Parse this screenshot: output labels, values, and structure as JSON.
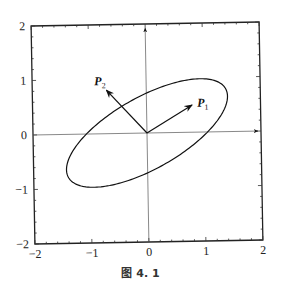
{
  "chart_data": {
    "type": "line",
    "title": "",
    "xlabel": "",
    "ylabel": "",
    "xlim": [
      -2,
      2
    ],
    "ylim": [
      -2,
      2
    ],
    "x_ticks": [
      "-2",
      "-1",
      "0",
      "1",
      "2"
    ],
    "y_ticks": [
      "-2",
      "-1",
      "0",
      "1",
      "2"
    ],
    "x_tick_values": [
      -2,
      -1,
      0,
      1,
      2
    ],
    "y_tick_values": [
      -2,
      -1,
      0,
      1,
      2
    ],
    "grid": false,
    "axes_through_origin": true,
    "ellipse": {
      "center": [
        0,
        0
      ],
      "semi_major": 1.6,
      "semi_minor": 0.65,
      "rotation_deg": 30
    },
    "vectors": [
      {
        "name": "P",
        "subscript": "1",
        "from": [
          0,
          0
        ],
        "to": [
          0.8,
          0.5
        ]
      },
      {
        "name": "P",
        "subscript": "2",
        "from": [
          0,
          0
        ],
        "to": [
          -0.7,
          0.8
        ]
      }
    ]
  },
  "caption": "图 4. 1"
}
